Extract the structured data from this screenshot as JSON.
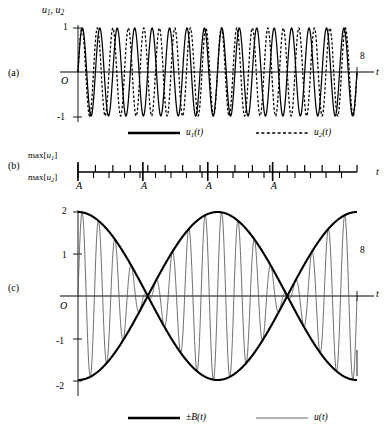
{
  "figure": {
    "panels": [
      {
        "tag": "(a)",
        "y_axis_label": "u1, u2",
        "x_axis_label": "t",
        "y_ticks": [
          "1",
          "O",
          "-1"
        ],
        "x_end_label": "8"
      },
      {
        "tag": "(b)",
        "row_label_1": "max[u1]",
        "row_label_2": "max[u2]",
        "x_axis_label": "t",
        "beat_marks": [
          "A",
          "A",
          "A",
          "A"
        ]
      },
      {
        "tag": "(c)",
        "x_axis_label": "t",
        "y_ticks": [
          "2",
          "1",
          "O",
          "-1",
          "-2"
        ],
        "x_end_label": "8"
      }
    ],
    "legend_a": [
      {
        "label": "u1(t)",
        "style": "solid"
      },
      {
        "label": "u2(t)",
        "style": "dashed"
      }
    ],
    "legend_c": [
      {
        "label": "±B(t)",
        "style": "thick-solid"
      },
      {
        "label": "u(t)",
        "style": "thin-solid"
      }
    ]
  },
  "chart_data": {
    "type": "line",
    "title": "",
    "xlabel": "t",
    "panels": [
      {
        "name": "a",
        "ylabel": "u1, u2",
        "xlim": [
          0,
          8.6
        ],
        "ylim": [
          -1.25,
          1.25
        ],
        "yticks": [
          1,
          0,
          -1
        ],
        "xticks_labeled": [
          8
        ],
        "series": [
          {
            "name": "u1(t)",
            "style": "solid",
            "amplitude": 1,
            "cycles_over_span": 16,
            "phase_deg": 0
          },
          {
            "name": "u2(t)",
            "style": "dashed",
            "amplitude": 1,
            "cycles_over_span": 18,
            "phase_deg": 0
          }
        ]
      },
      {
        "name": "b",
        "ylabel": "max[u1] / max[u2]",
        "xlim": [
          0,
          8.6
        ],
        "description": "Tick marks showing alignment of maxima of u1 (up ticks) and u2 (down ticks); coincidences labelled A",
        "coincidence_positions_t": [
          0,
          2,
          4,
          6
        ],
        "coincidence_labels": [
          "A",
          "A",
          "A",
          "A"
        ],
        "n_ticks_u1": 17,
        "n_ticks_u2": 18
      },
      {
        "name": "c",
        "ylabel": "u",
        "xlim": [
          0,
          8.6
        ],
        "ylim": [
          -2.4,
          2.4
        ],
        "yticks": [
          2,
          1,
          0,
          -1,
          -2
        ],
        "xticks_labeled": [
          8
        ],
        "series": [
          {
            "name": "+B(t)",
            "style": "thick-solid",
            "amplitude": 2,
            "cycles_over_span": 1,
            "envelope": true
          },
          {
            "name": "-B(t)",
            "style": "thick-solid",
            "amplitude": 2,
            "cycles_over_span": 1,
            "envelope": true
          },
          {
            "name": "u(t)",
            "style": "thin-solid",
            "amplitude": 2,
            "carrier_cycles_over_span": 17,
            "envelope_cycles_over_span": 1
          }
        ]
      }
    ]
  }
}
